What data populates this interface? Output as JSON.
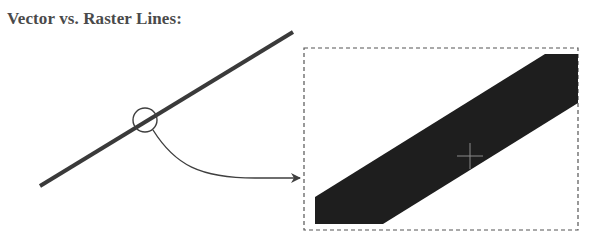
{
  "title": "Vector vs. Raster Lines:",
  "colors": {
    "vector_line": "#3a3a3a",
    "raster_fill": "#1e1e1e",
    "crosshair": "#8a8a8a",
    "box_border": "#555555",
    "arrow": "#3f3f3f",
    "title_text": "#4a4a4a"
  },
  "vector_panel": {
    "label": "vector-line",
    "line": {
      "x1": 40,
      "y1": 186,
      "x2": 293,
      "y2": 32,
      "stroke_width": 4
    },
    "magnifier": {
      "cx": 145,
      "cy": 120,
      "r": 12
    }
  },
  "connector": {
    "path": "M153,130 C175,165 200,178 255,178 L300,178"
  },
  "raster_panel": {
    "label": "raster-zoom-box",
    "box": {
      "x": 304,
      "y": 48,
      "width": 274,
      "height": 182
    },
    "band_points": "315,197 315,224 383,224 578,103 578,54 545,54",
    "crosshair": {
      "cx": 470,
      "cy": 156,
      "size": 13
    }
  }
}
